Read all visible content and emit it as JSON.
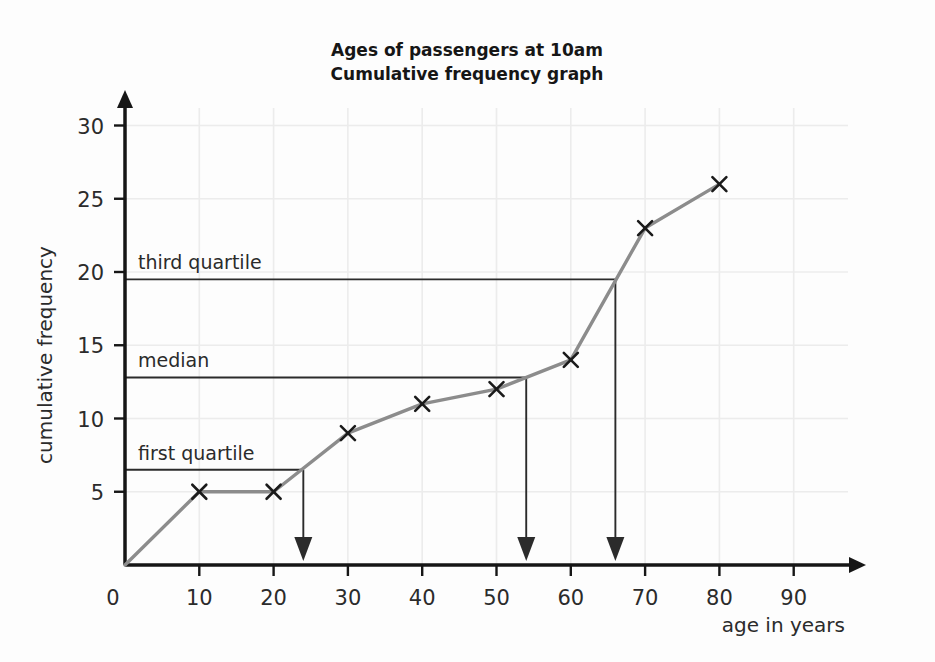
{
  "chart_data": {
    "type": "line",
    "title": "Ages of passengers at 10am\nCumulative frequency graph",
    "title_line1": "Ages of passengers at 10am",
    "title_line2": "Cumulative frequency graph",
    "xlabel": "age in years",
    "ylabel": "cumulative frequency",
    "xlim": [
      0,
      95
    ],
    "ylim": [
      0,
      31
    ],
    "xticks": [
      0,
      10,
      20,
      30,
      40,
      50,
      60,
      70,
      80,
      90
    ],
    "xtick_labels": [
      "0",
      "10",
      "20",
      "30",
      "40",
      "50",
      "60",
      "70",
      "80",
      "90"
    ],
    "yticks": [
      0,
      5,
      10,
      15,
      20,
      25,
      30
    ],
    "ytick_labels": [
      "0",
      "5",
      "10",
      "15",
      "20",
      "25",
      "30"
    ],
    "grid": true,
    "legend": false,
    "series": [
      {
        "name": "cumulative frequency",
        "marker": "x",
        "color": "#8c8c8c",
        "x": [
          0,
          10,
          20,
          30,
          40,
          50,
          60,
          70,
          80
        ],
        "values": [
          0,
          5,
          5,
          9,
          11,
          12,
          14,
          23,
          26
        ]
      }
    ],
    "annotations": [
      {
        "name": "third-quartile",
        "label": "third quartile",
        "y_value": 19.5,
        "x_value": 66.0,
        "label_x": 13
      },
      {
        "name": "median",
        "label": "median",
        "y_value": 12.8,
        "x_value": 54.0,
        "label_x": 13
      },
      {
        "name": "first-quartile",
        "label": "first quartile",
        "y_value": 6.5,
        "x_value": 24.0,
        "label_x": 13
      }
    ],
    "colors": {
      "curve": "#8c8c8c",
      "marker": "#1a1a1a",
      "axis": "#161616",
      "grid": "#ececec",
      "annotation": "#2b2b2b",
      "background": "#fdfdfd"
    }
  }
}
